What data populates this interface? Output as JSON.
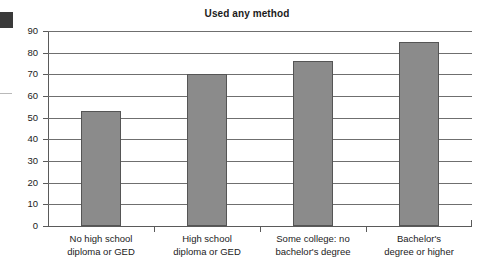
{
  "chart_data": {
    "type": "bar",
    "title": "Used any method",
    "xlabel": "",
    "ylabel": "",
    "ylim": [
      0,
      90
    ],
    "ytick_step": 10,
    "yticks": [
      90,
      80,
      70,
      60,
      50,
      40,
      30,
      20,
      10,
      0
    ],
    "grid": true,
    "legend": "none",
    "bar_color": "#8b8b8b",
    "bar_edge_color": "#555555",
    "categories": [
      "No high school diploma or GED",
      "High school diploma or GED",
      "Some college: no bachelor's degree",
      "Bachelor's degree or higher"
    ],
    "category_lines": [
      [
        "No high school",
        "diploma or GED"
      ],
      [
        "High school",
        "diploma or GED"
      ],
      [
        "Some college: no",
        "bachelor's degree"
      ],
      [
        "Bachelor's",
        "degree or higher"
      ]
    ],
    "values": [
      53,
      70,
      76,
      85
    ]
  }
}
